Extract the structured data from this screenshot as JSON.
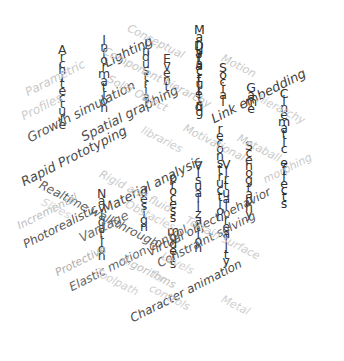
{
  "canvas": {
    "width": 344,
    "height": 361,
    "background": "#ffffff"
  },
  "chart_data": {
    "type": "wordcloud",
    "title": "",
    "xlabel": "",
    "ylabel": "",
    "background": "#ffffff",
    "words": [
      "Architecture",
      "Information",
      "Lighting",
      "Parametric",
      "Profiles",
      "Growth simulation",
      "Industrial",
      "Rapid Prototyping",
      "Realtime walkthrough",
      "Incremental",
      "Slices",
      "Navigation",
      "Photorealistic",
      "Vantage",
      "Protective",
      "Elastic motion control",
      "design",
      "process models",
      "Manufacturing",
      "Component hierarchy",
      "Event",
      "Spatial graphing",
      "Data field",
      "Material analysis",
      "Algorithms",
      "reconstruction",
      "Constraint solving",
      "Visualization",
      "Virtual reality",
      "Virtual object behavior",
      "Character animation",
      "Social",
      "Link embedding",
      "Game",
      "Scenography",
      "Cinematic",
      "Cinematic effects",
      "Motion",
      "Metaball",
      "hierarchy",
      "morphing",
      "Levels",
      "Metal",
      "Terrain surface",
      "Obstacles",
      "Toolpath",
      "Solid Object",
      "libraries",
      "Motivational",
      "Conceptual",
      "Rigid and fluid",
      "controls",
      "for"
    ]
  },
  "items": [
    {
      "text": "Architecture",
      "color": "#3a3a3a"
    },
    {
      "text": "Information",
      "color": "#3a3a3a"
    },
    {
      "text": "Lighting",
      "color": "#4a4a4a"
    },
    {
      "text": "Parametric",
      "color": "#c9c9c9"
    },
    {
      "text": "Profiles",
      "color": "#cccccc"
    },
    {
      "text": "Growth simulation",
      "color": "#555555"
    },
    {
      "text": "Industrial",
      "color": "#3f3f3f"
    },
    {
      "text": "Rapid Prototyping",
      "color": "#4a4a4a"
    },
    {
      "text": "Realtime walkthrough",
      "color": "#5c5c5c"
    },
    {
      "text": "Incremental",
      "color": "#bdbdbd"
    },
    {
      "text": "Slices",
      "color": "#d5d5d5"
    },
    {
      "text": "Navigation",
      "color": "#3a3a3a"
    },
    {
      "text": "Photorealistic",
      "color": "#555555"
    },
    {
      "text": "Vantage",
      "color": "#6d6d6d"
    },
    {
      "text": "Protective",
      "color": "#aeaeae"
    },
    {
      "text": "Elastic motion control",
      "color": "#666666"
    },
    {
      "text": "design",
      "color": "#333333"
    },
    {
      "text": "process models",
      "color": "#2e2e2e"
    },
    {
      "text": "Manufacturing",
      "color": "#2b2b2b"
    },
    {
      "text": "Component hierarchy",
      "color": "#c4c4c4"
    },
    {
      "text": "Event",
      "color": "#3a3a3a"
    },
    {
      "text": "Spatial graphing",
      "color": "#4f4f4f"
    },
    {
      "text": "Data field",
      "color": "#2e2e2e"
    },
    {
      "text": "Material analysis",
      "color": "#4a4a4a"
    },
    {
      "text": "Algorithms",
      "color": "#c0c0c0"
    },
    {
      "text": "reconstruction",
      "color": "#333333"
    },
    {
      "text": "Constraint solving",
      "color": "#5a5a5a"
    },
    {
      "text": "Visualization",
      "color": "#333333"
    },
    {
      "text": "Virtual reality",
      "color": "#333333"
    },
    {
      "text": "Virtual object behavior",
      "color": "#555555"
    },
    {
      "text": "Character animation",
      "color": "#4a4a4a"
    },
    {
      "text": "Social",
      "color": "#2e2e2e"
    },
    {
      "text": "Link embedding",
      "color": "#3f3f3f"
    },
    {
      "text": "Game",
      "color": "#2e2e2e"
    },
    {
      "text": "Scenography",
      "color": "#333333"
    },
    {
      "text": "Cinematic effects",
      "color": "#2e2e2e"
    },
    {
      "text": "Motion",
      "color": "#c9c9c9"
    },
    {
      "text": "Metaball",
      "color": "#c9c9c9"
    },
    {
      "text": "hierarchy",
      "color": "#cccccc"
    },
    {
      "text": "morphing",
      "color": "#c9c9c9"
    },
    {
      "text": "Levels",
      "color": "#cfcfcf"
    },
    {
      "text": "Metal",
      "color": "#cfcfcf"
    },
    {
      "text": "Terrain surface",
      "color": "#cbcbcb"
    },
    {
      "text": "Obstacles",
      "color": "#cdcdcd"
    },
    {
      "text": "Toolpath",
      "color": "#d0d0d0"
    },
    {
      "text": "Solid Object",
      "color": "#c8c8c8"
    },
    {
      "text": "libraries",
      "color": "#cdcdcd"
    },
    {
      "text": "Motivational",
      "color": "#c8c8c8"
    },
    {
      "text": "Conceptual",
      "color": "#c8c8c8"
    },
    {
      "text": "Rigid and fluid",
      "color": "#c9c9c9"
    },
    {
      "text": "controls",
      "color": "#cccccc"
    },
    {
      "text": "for",
      "color": "#d2d2d2"
    }
  ]
}
